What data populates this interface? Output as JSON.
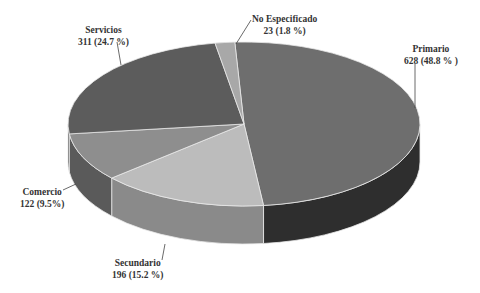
{
  "chart_data": {
    "type": "pie",
    "style": "3d",
    "title": "",
    "categories": [
      "Primario",
      "Secundario",
      "Comercio",
      "Servicios",
      "No Especificado"
    ],
    "values": [
      628,
      196,
      122,
      311,
      23
    ],
    "percentages": [
      48.8,
      15.2,
      9.5,
      24.7,
      1.8
    ],
    "labels": [
      {
        "name": "Primario",
        "value_text": "628 (48.8 % )"
      },
      {
        "name": "Secundario",
        "value_text": "196 (15.2 %)"
      },
      {
        "name": "Comercio",
        "value_text": "122 (9.5%)"
      },
      {
        "name": "Servicios",
        "value_text": "311 (24.7 %)"
      },
      {
        "name": "No Especificado",
        "value_text": "23 (1.8 %)"
      }
    ],
    "colors": {
      "Primario": {
        "top": "#6e6e6e",
        "side": "#2e2e2e"
      },
      "Secundario": {
        "top": "#bcbcbc",
        "side": "#8a8a8a"
      },
      "Comercio": {
        "top": "#8e8e8e",
        "side": "#5a5a5a"
      },
      "Servicios": {
        "top": "#5c5c5c",
        "side": "#3c3c3c"
      },
      "No Especificado": {
        "top": "#a8a8a8",
        "side": "#808080"
      }
    },
    "legend": "none"
  }
}
